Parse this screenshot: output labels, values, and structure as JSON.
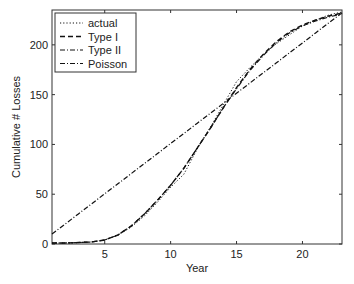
{
  "chart_data": {
    "type": "line",
    "title": "",
    "xlabel": "Year",
    "ylabel": "Cumulative # Losses",
    "xlim": [
      1,
      23
    ],
    "ylim": [
      0,
      235
    ],
    "xticks": [
      5,
      10,
      15,
      20
    ],
    "yticks": [
      0,
      50,
      100,
      150,
      200
    ],
    "grid": false,
    "legend_position": "top-left",
    "x": [
      1,
      2,
      3,
      4,
      5,
      6,
      7,
      8,
      9,
      10,
      11,
      12,
      13,
      14,
      15,
      16,
      17,
      18,
      19,
      20,
      21,
      22,
      23
    ],
    "series": [
      {
        "name": "actual",
        "style": "dotted",
        "values": [
          1,
          1,
          1.5,
          2,
          4,
          9,
          17,
          28,
          42,
          57,
          70,
          95,
          117,
          140,
          163,
          177,
          190,
          201,
          210,
          219,
          225,
          230,
          233
        ]
      },
      {
        "name": "Type I",
        "style": "dashed",
        "values": [
          1,
          1,
          1.5,
          2,
          4,
          9,
          18,
          30,
          44,
          59,
          76,
          96,
          116,
          137,
          157,
          175,
          190,
          203,
          213,
          220,
          225,
          229,
          232
        ]
      },
      {
        "name": "Type II",
        "style": "dashdot",
        "values": [
          1,
          1,
          1.5,
          2,
          4,
          9,
          18,
          30,
          44,
          59,
          76,
          96,
          116,
          137,
          156,
          174,
          189,
          202,
          212,
          219,
          224,
          228,
          231
        ]
      },
      {
        "name": "Poisson",
        "style": "dashdot",
        "values": [
          10,
          20.1,
          30.2,
          40.3,
          50.4,
          60.5,
          70.6,
          80.7,
          90.8,
          100.9,
          111,
          121.1,
          131.2,
          141.3,
          151.4,
          161.5,
          171.6,
          181.7,
          191.8,
          201.9,
          212,
          222.1,
          232.2
        ]
      }
    ]
  }
}
